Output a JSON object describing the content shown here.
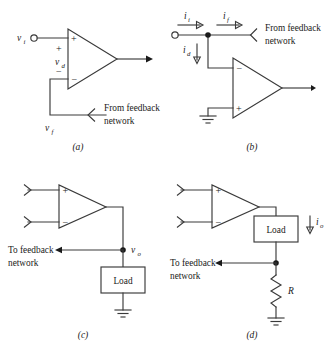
{
  "figure": {
    "panels": [
      {
        "id": "a",
        "label": "(a)",
        "kind": "series-input-voltage-mixing",
        "labels": {
          "input": "v",
          "input_sub": "i",
          "diff": "v",
          "diff_sub": "d",
          "feedback_volt": "v",
          "feedback_volt_sub": "f",
          "plus_input": "+",
          "minus_input": "−",
          "plus_diff": "+",
          "minus_diff": "−",
          "note_line1": "From feedback",
          "note_line2": "network"
        }
      },
      {
        "id": "b",
        "label": "(b)",
        "kind": "shunt-input-current-mixing",
        "labels": {
          "current_in": "i",
          "current_in_sub": "i",
          "current_fb": "i",
          "current_fb_sub": "f",
          "current_diff": "i",
          "current_diff_sub": "d",
          "minus_input": "−",
          "plus_input": "+",
          "note_line1": "From feedback",
          "note_line2": "network"
        }
      },
      {
        "id": "c",
        "label": "(c)",
        "kind": "voltage-sampling-output",
        "labels": {
          "plus_input": "+",
          "minus_input": "−",
          "output": "v",
          "output_sub": "o",
          "load": "Load",
          "note_line1": "To feedback",
          "note_line2": "network"
        }
      },
      {
        "id": "d",
        "label": "(d)",
        "kind": "current-sampling-output",
        "labels": {
          "plus_input": "+",
          "minus_input": "−",
          "output_current": "i",
          "output_current_sub": "o",
          "load": "Load",
          "resistor": "R",
          "note_line1": "To feedback",
          "note_line2": "network"
        }
      }
    ],
    "colors": {
      "wire": "#3a3a3a",
      "text": "#1a1a1a",
      "background": "#ffffff"
    }
  }
}
